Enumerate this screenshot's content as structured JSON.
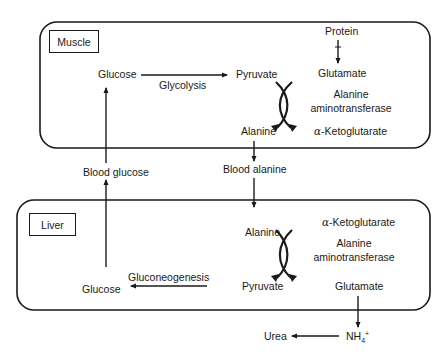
{
  "compartments": {
    "muscle": {
      "label": "Muscle",
      "nodes": {
        "glucose": "Glucose",
        "glycolysis": "Glycolysis",
        "pyruvate": "Pyruvate",
        "protein": "Protein",
        "glutamate": "Glutamate",
        "enzyme_line1": "Alanine",
        "enzyme_line2": "aminotransferase",
        "alanine": "Alanine",
        "alpha": "α",
        "ketoglutarate": "-Ketoglutarate"
      }
    },
    "liver": {
      "label": "Liver",
      "nodes": {
        "alanine": "Alanine",
        "alpha": "α",
        "ketoglutarate": "-Ketoglutarate",
        "enzyme_line1": "Alanine",
        "enzyme_line2": "aminotransferase",
        "pyruvate": "Pyruvate",
        "glutamate": "Glutamate",
        "glucose": "Glucose",
        "gluconeogenesis": "Gluconeogenesis"
      }
    }
  },
  "blood": {
    "glucose": "Blood glucose",
    "alanine": "Blood alanine"
  },
  "outputs": {
    "urea": "Urea",
    "ammonium": "NH",
    "ammonium_sub": "4",
    "ammonium_sup": "+"
  },
  "colors": {
    "stroke": "#1a1a1a",
    "background": "#ffffff"
  }
}
